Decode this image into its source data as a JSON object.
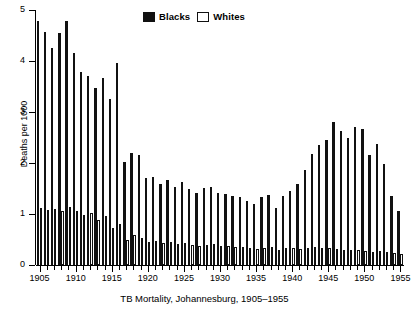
{
  "chart_data": {
    "type": "bar",
    "title": "",
    "caption": "TB Mortality, Johannesburg, 1905–1955",
    "xlabel": "",
    "ylabel": "Deaths per 1000",
    "ylim": [
      0,
      5
    ],
    "y_ticks": [
      0,
      1,
      2,
      3,
      4,
      5
    ],
    "y_tick_labels": [
      "0",
      "1",
      "2",
      "3",
      "4",
      "5"
    ],
    "x_major_ticks": [
      1905,
      1910,
      1915,
      1920,
      1925,
      1930,
      1935,
      1940,
      1945,
      1950,
      1955
    ],
    "x_major_tick_labels": [
      "1905",
      "1910",
      "1915",
      "1920",
      "1925",
      "1930",
      "1935",
      "1940",
      "1945",
      "1950",
      "1955"
    ],
    "xlim": [
      1905,
      1955
    ],
    "grid": false,
    "legend_position": "top-center",
    "categories": [
      1905,
      1906,
      1907,
      1908,
      1909,
      1910,
      1911,
      1912,
      1913,
      1914,
      1915,
      1916,
      1917,
      1918,
      1919,
      1920,
      1921,
      1922,
      1923,
      1924,
      1925,
      1926,
      1927,
      1928,
      1929,
      1930,
      1931,
      1932,
      1933,
      1934,
      1935,
      1936,
      1937,
      1938,
      1939,
      1940,
      1941,
      1942,
      1943,
      1944,
      1945,
      1946,
      1947,
      1948,
      1949,
      1950,
      1951,
      1952,
      1953,
      1954,
      1955
    ],
    "series": [
      {
        "name": "Blacks",
        "color": "#111111",
        "values": [
          4.78,
          4.56,
          4.25,
          4.55,
          4.78,
          4.15,
          3.78,
          3.7,
          3.47,
          3.67,
          3.25,
          3.96,
          2.02,
          2.19,
          2.15,
          1.7,
          1.72,
          1.58,
          1.66,
          1.53,
          1.62,
          1.5,
          1.41,
          1.51,
          1.52,
          1.42,
          1.39,
          1.35,
          1.33,
          1.25,
          1.2,
          1.33,
          1.38,
          1.12,
          1.35,
          1.45,
          1.58,
          1.86,
          2.18,
          2.35,
          2.45,
          2.8,
          2.62,
          2.5,
          2.7,
          2.67,
          2.15,
          2.37,
          1.98,
          1.35,
          1.05
        ]
      },
      {
        "name": "Whites",
        "color": "#ffffff",
        "values": [
          1.12,
          1.08,
          1.1,
          1.05,
          1.13,
          1.05,
          0.98,
          1.02,
          0.88,
          0.96,
          0.72,
          0.8,
          0.5,
          0.58,
          0.52,
          0.46,
          0.48,
          0.43,
          0.45,
          0.42,
          0.44,
          0.4,
          0.38,
          0.4,
          0.41,
          0.38,
          0.37,
          0.36,
          0.35,
          0.33,
          0.32,
          0.34,
          0.35,
          0.3,
          0.33,
          0.34,
          0.32,
          0.33,
          0.35,
          0.34,
          0.33,
          0.32,
          0.3,
          0.29,
          0.3,
          0.28,
          0.26,
          0.27,
          0.26,
          0.24,
          0.22
        ]
      }
    ]
  },
  "legend": {
    "entries": [
      {
        "label": "Blacks",
        "swatch": "filled-square-icon"
      },
      {
        "label": "Whites",
        "swatch": "hollow-square-icon"
      }
    ]
  }
}
